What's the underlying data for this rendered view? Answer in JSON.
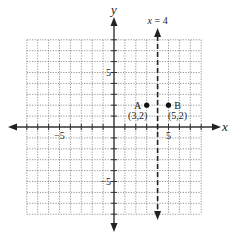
{
  "chart_data": {
    "type": "scatter",
    "title": "",
    "xlabel": "x",
    "ylabel": "y",
    "xlim": [
      -8,
      8
    ],
    "ylim": [
      -8,
      8
    ],
    "grid": true,
    "grid_style": "dotted",
    "x_tick_labels": [
      {
        "value": -5,
        "text": "−5"
      },
      {
        "value": 5,
        "text": "5"
      }
    ],
    "y_tick_labels": [
      {
        "value": 5,
        "text": "5"
      },
      {
        "value": -5,
        "text": "−5"
      }
    ],
    "points": [
      {
        "name": "A",
        "x": 3,
        "y": 2,
        "label": "A",
        "coord_label": "(3,2)"
      },
      {
        "name": "B",
        "x": 5,
        "y": 2,
        "label": "B",
        "coord_label": "(5,2)"
      }
    ],
    "lines": [
      {
        "type": "vertical",
        "x": 4,
        "style": "dashed",
        "label": "x = 4",
        "label_var": "x",
        "label_rest": " = 4"
      }
    ],
    "legend": null
  },
  "geometry": {
    "origin_x": 114,
    "origin_y": 127,
    "unit": 10.9,
    "color_ink": "#222222",
    "color_grid": "#7a7a7a"
  }
}
